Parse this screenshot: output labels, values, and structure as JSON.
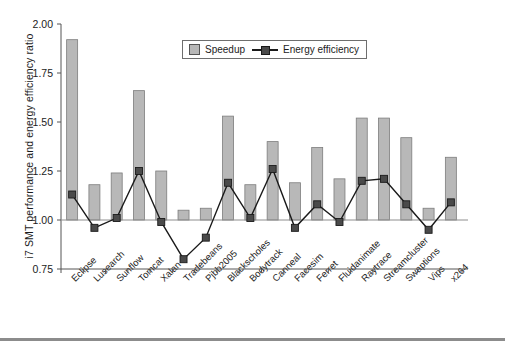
{
  "chart_data": {
    "type": "bar",
    "title": "",
    "xlabel": "",
    "ylabel": "i7 SMT performance and energy efficiency ratio",
    "ylim": [
      0.75,
      2.0
    ],
    "yticks": [
      "0.75",
      "1.00",
      "1.25",
      "1.50",
      "1.75",
      "2.00"
    ],
    "ytick_values": [
      0.75,
      1.0,
      1.25,
      1.5,
      1.75,
      2.0
    ],
    "grid": false,
    "baseline": 1.0,
    "legend_position": "top-center",
    "categories": [
      "Eclipse",
      "Lusearch",
      "Sunflow",
      "Tomcat",
      "Xalan",
      "Tradebeans",
      "Pjbb2005",
      "Blackscholes",
      "Bodytrack",
      "Canneal",
      "Facesim",
      "Ferret",
      "Fluidanimate",
      "Raytrace",
      "Streamcluster",
      "Swaptions",
      "Vips",
      "x264"
    ],
    "series": [
      {
        "name": "Speedup",
        "type": "bar",
        "color": "#b8b8b8",
        "values": [
          1.92,
          1.18,
          1.24,
          1.66,
          1.25,
          1.05,
          1.06,
          1.53,
          1.18,
          1.4,
          1.19,
          1.37,
          1.21,
          1.52,
          1.52,
          1.42,
          1.06,
          1.32
        ]
      },
      {
        "name": "Energy efficiency",
        "type": "line",
        "color": "#1a1a1a",
        "marker_color": "#4a4a4a",
        "values": [
          1.13,
          0.96,
          1.01,
          1.25,
          0.99,
          0.8,
          0.91,
          1.19,
          1.01,
          1.26,
          0.96,
          1.08,
          0.99,
          1.2,
          1.21,
          1.08,
          0.95,
          1.09
        ]
      }
    ]
  },
  "legend": {
    "items": [
      {
        "label": "Speedup"
      },
      {
        "label": "Energy efficiency"
      }
    ]
  }
}
